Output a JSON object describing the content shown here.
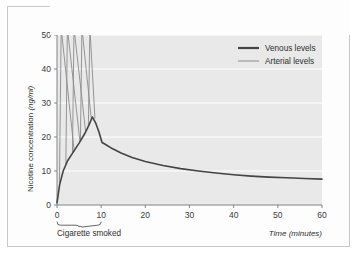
{
  "figure": {
    "background_color": "#ffffff",
    "plot_background_color": "#e9e9e9",
    "border_color": "#c9c9c9",
    "gridline_color": "#ffffff",
    "axis_color": "#555555"
  },
  "chart_data": {
    "type": "line",
    "title": "",
    "xlabel": "Time (minutes)",
    "ylabel": "Nicotine concentration (ng/ml)",
    "xlim": [
      0,
      60
    ],
    "ylim": [
      0,
      50
    ],
    "xticks": [
      0,
      10,
      20,
      30,
      40,
      50,
      60
    ],
    "yticks": [
      0,
      10,
      20,
      30,
      40,
      50
    ],
    "xtick_labels": [
      "0",
      "10",
      "20",
      "30",
      "40",
      "50",
      "60"
    ],
    "ytick_labels": [
      "0",
      "10",
      "20",
      "30",
      "40",
      "50"
    ],
    "grid": "horizontal",
    "legend_position": "top-right",
    "legend": [
      "Venous levels",
      "Arterial levels"
    ],
    "annotations": [
      {
        "text": "Cigarette smoked",
        "type": "brace",
        "x_start": 0,
        "x_end": 10,
        "position": "below-axis"
      }
    ],
    "series": [
      {
        "name": "Venous levels",
        "color": "#444444",
        "width": 1.6,
        "x": [
          0,
          0.6,
          1.4,
          2.4,
          3.6,
          5.0,
          6.2,
          7.2,
          8.0,
          8.8,
          9.5,
          10.2,
          11.0,
          12.5,
          14.5,
          17,
          20,
          24,
          28,
          32,
          36,
          40,
          44,
          48,
          52,
          56,
          60
        ],
        "y": [
          0.6,
          6.0,
          10.0,
          13.0,
          15.4,
          18.2,
          20.8,
          23.4,
          25.9,
          24.0,
          21.5,
          18.4,
          17.8,
          16.6,
          15.3,
          14.0,
          12.8,
          11.6,
          10.7,
          10.0,
          9.4,
          8.9,
          8.5,
          8.2,
          8.0,
          7.8,
          7.6
        ]
      },
      {
        "name": "Arterial levels",
        "color": "#8a8a8a",
        "width": 0.9,
        "spikes": [
          {
            "rise_x": 0.55,
            "peak_x": 0.95,
            "peak_y": 52,
            "base_y": 6.5,
            "return_x": 3.9,
            "return_y": 15.8
          },
          {
            "rise_x": 2.0,
            "peak_x": 2.35,
            "peak_y": 52,
            "base_y": 11.8,
            "return_x": 5.2,
            "return_y": 18.6
          },
          {
            "rise_x": 3.5,
            "peak_x": 3.85,
            "peak_y": 52,
            "base_y": 15.2,
            "return_x": 6.5,
            "return_y": 21.4
          },
          {
            "rise_x": 5.3,
            "peak_x": 5.65,
            "peak_y": 52,
            "base_y": 18.8,
            "return_x": 7.8,
            "return_y": 24.9
          },
          {
            "rise_x": 7.1,
            "peak_x": 7.45,
            "peak_y": 52,
            "base_y": 23.2,
            "return_x": 8.6,
            "return_y": 25.4
          }
        ]
      }
    ]
  },
  "legend_items": [
    {
      "label": "Venous levels",
      "color": "#444444",
      "width": 2.2
    },
    {
      "label": "Arterial levels",
      "color": "#8a8a8a",
      "width": 1.0
    }
  ],
  "labels": {
    "y_axis_title": "Nicotine concentration (ng/ml)",
    "y_axis_title_main": "Nicotine concentration ",
    "y_axis_title_unit": "(ng/ml)",
    "x_axis_title": "Time (minutes)",
    "cigarette_annotation": "Cigarette smoked"
  }
}
